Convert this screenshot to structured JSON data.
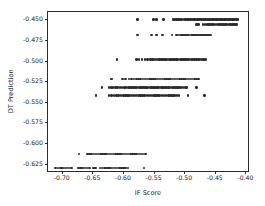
{
  "chart_data": {
    "type": "scatter",
    "title": "",
    "xlabel": "IF Score",
    "ylabel": "DT Prediction",
    "xlim": [
      -0.7225,
      -0.3925
    ],
    "ylim": [
      -0.6365,
      -0.441
    ],
    "xticks": [
      -0.7,
      -0.65,
      -0.6,
      -0.55,
      -0.5,
      -0.45,
      -0.4
    ],
    "xticklabels": [
      "-0.70",
      "-0.65",
      "-0.60",
      "-0.55",
      "-0.50",
      "-0.45",
      "-0.40"
    ],
    "yticks": [
      -0.45,
      -0.475,
      -0.5,
      -0.525,
      -0.55,
      -0.575,
      -0.6,
      -0.625
    ],
    "yticklabels": [
      "-0.450",
      "-0.475",
      "-0.500",
      "-0.525",
      "-0.550",
      "-0.575",
      "-0.600",
      "-0.625"
    ],
    "grid": false,
    "legend": null,
    "marker": "circle",
    "marker_color": "#2b2b2b",
    "marker_size": 2.6,
    "series": [
      {
        "name": "samples",
        "levels": [
          {
            "y": -0.45,
            "x": [
              -0.576,
              -0.5505,
              -0.5455,
              -0.534,
              -0.5185,
              -0.5155,
              -0.5125,
              -0.5095,
              -0.5065,
              -0.5035,
              -0.5005,
              -0.4975,
              -0.495,
              -0.4925,
              -0.49,
              -0.4875,
              -0.485,
              -0.4828,
              -0.4806,
              -0.4784,
              -0.4762,
              -0.474,
              -0.4718,
              -0.4696,
              -0.4674,
              -0.4652,
              -0.463,
              -0.4608,
              -0.4586,
              -0.4564,
              -0.4542,
              -0.452,
              -0.4498,
              -0.4476,
              -0.4454,
              -0.4432,
              -0.441,
              -0.4388,
              -0.4366,
              -0.4344,
              -0.4322,
              -0.43,
              -0.4278,
              -0.4256,
              -0.4234,
              -0.4212,
              -0.419,
              -0.4168,
              -0.4146,
              -0.4124
            ]
          },
          {
            "y": -0.456,
            "x": [
              -0.48,
              -0.477,
              -0.469,
              -0.466,
              -0.463,
              -0.46,
              -0.457,
              -0.454,
              -0.451,
              -0.448,
              -0.445,
              -0.442,
              -0.439,
              -0.436,
              -0.433,
              -0.43,
              -0.427,
              -0.424,
              -0.421,
              -0.418,
              -0.415
            ]
          },
          {
            "y": -0.469,
            "x": [
              -0.576,
              -0.553,
              -0.5455,
              -0.5355,
              -0.52,
              -0.513,
              -0.51,
              -0.507,
              -0.504,
              -0.501,
              -0.498,
              -0.495,
              -0.492,
              -0.489,
              -0.486,
              -0.4835,
              -0.481,
              -0.4785,
              -0.476,
              -0.4735,
              -0.471,
              -0.4685,
              -0.466,
              -0.4635,
              -0.461,
              -0.4585,
              -0.456
            ]
          },
          {
            "y": -0.4985,
            "x": [
              -0.61,
              -0.578,
              -0.574,
              -0.569,
              -0.564,
              -0.56,
              -0.5555,
              -0.552,
              -0.549,
              -0.546,
              -0.543,
              -0.54,
              -0.537,
              -0.534,
              -0.531,
              -0.528,
              -0.525,
              -0.522,
              -0.519,
              -0.516,
              -0.513,
              -0.51,
              -0.507,
              -0.504,
              -0.501,
              -0.498,
              -0.495,
              -0.492,
              -0.489,
              -0.486,
              -0.483,
              -0.48,
              -0.477,
              -0.474,
              -0.471,
              -0.468,
              -0.465
            ]
          },
          {
            "y": -0.5225,
            "x": [
              -0.6185,
              -0.6005,
              -0.5955,
              -0.5905,
              -0.586,
              -0.582,
              -0.578,
              -0.5745,
              -0.571,
              -0.5675,
              -0.564,
              -0.5605,
              -0.557,
              -0.5535,
              -0.55,
              -0.5465,
              -0.543,
              -0.5395,
              -0.536,
              -0.5325,
              -0.529,
              -0.5255,
              -0.522,
              -0.5185,
              -0.515,
              -0.5115,
              -0.508,
              -0.5045,
              -0.501,
              -0.4975,
              -0.494,
              -0.4905,
              -0.487,
              -0.4835,
              -0.48,
              -0.4765
            ]
          },
          {
            "y": -0.533,
            "x": [
              -0.6345,
              -0.623,
              -0.619,
              -0.616,
              -0.612,
              -0.6085,
              -0.605,
              -0.6015,
              -0.598,
              -0.595,
              -0.592,
              -0.589,
              -0.586,
              -0.583,
              -0.58,
              -0.577,
              -0.574,
              -0.571,
              -0.568,
              -0.565,
              -0.562,
              -0.559,
              -0.556,
              -0.553,
              -0.55,
              -0.547,
              -0.544,
              -0.541,
              -0.538,
              -0.535,
              -0.532,
              -0.529,
              -0.526,
              -0.523,
              -0.52,
              -0.517,
              -0.514,
              -0.511,
              -0.508,
              -0.505,
              -0.502,
              -0.499,
              -0.496,
              -0.48
            ]
          },
          {
            "y": -0.5425,
            "x": [
              -0.644,
              -0.623,
              -0.619,
              -0.615,
              -0.611,
              -0.607,
              -0.603,
              -0.5995,
              -0.596,
              -0.5925,
              -0.589,
              -0.5855,
              -0.582,
              -0.5785,
              -0.575,
              -0.5715,
              -0.568,
              -0.5645,
              -0.561,
              -0.5575,
              -0.554,
              -0.5505,
              -0.547,
              -0.5435,
              -0.54,
              -0.5365,
              -0.533,
              -0.5295,
              -0.526,
              -0.5225,
              -0.519,
              -0.5155,
              -0.512,
              -0.5085,
              -0.494,
              -0.4665
            ]
          },
          {
            "y": -0.6135,
            "x": [
              -0.672,
              -0.658,
              -0.6545,
              -0.651,
              -0.6475,
              -0.644,
              -0.6405,
              -0.637,
              -0.6335,
              -0.63,
              -0.6265,
              -0.623,
              -0.6195,
              -0.616,
              -0.6125,
              -0.609,
              -0.6055,
              -0.602,
              -0.5985,
              -0.595,
              -0.5915,
              -0.588,
              -0.5845,
              -0.581,
              -0.5775,
              -0.574,
              -0.5705,
              -0.567,
              -0.5635
            ]
          },
          {
            "y": -0.6305,
            "x": [
              -0.71,
              -0.706,
              -0.702,
              -0.6985,
              -0.695,
              -0.6915,
              -0.688,
              -0.6845,
              -0.673,
              -0.6695,
              -0.666,
              -0.662,
              -0.6585,
              -0.655,
              -0.648,
              -0.6445,
              -0.6375,
              -0.634,
              -0.6305,
              -0.627,
              -0.6235,
              -0.62,
              -0.6165,
              -0.613,
              -0.6095,
              -0.606,
              -0.6025,
              -0.599,
              -0.5955,
              -0.592,
              -0.566
            ]
          }
        ]
      }
    ]
  }
}
